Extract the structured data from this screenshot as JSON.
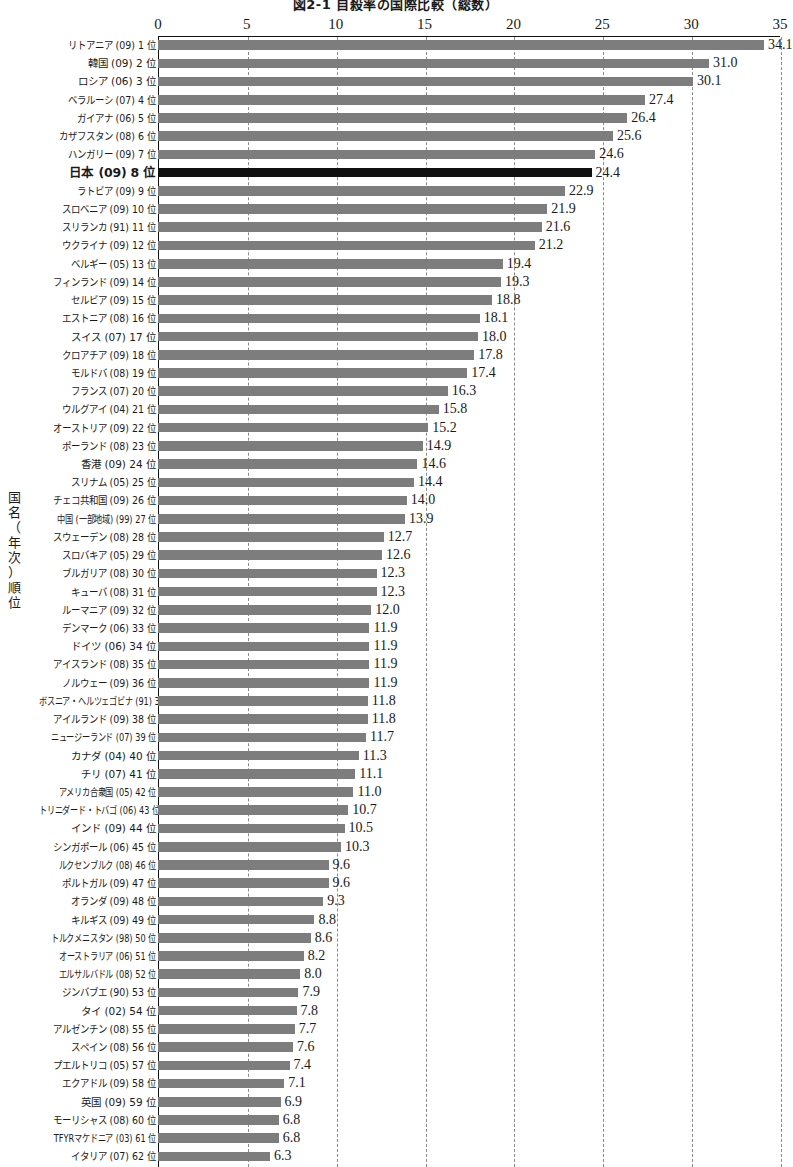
{
  "chart_data": {
    "type": "bar",
    "orientation": "horizontal",
    "title": "図2-1 自殺率の国際比較（総数）",
    "xlabel": "",
    "ylabel": "国名（年次）順位",
    "xlim": [
      0,
      35
    ],
    "xticks": [
      0,
      5,
      10,
      15,
      20,
      25,
      30,
      35
    ],
    "xtick_labels": [
      "0",
      "5",
      "10",
      "15",
      "20",
      "25",
      "30",
      "35"
    ],
    "grid": "vertical-dashed",
    "legend": "none",
    "highlight_category": "日本 (09)  8 位",
    "highlight_color": "#101010",
    "bar_color": "#7d7d7d",
    "categories": [
      "リトアニア (09)  1 位",
      "韓国 (09)  2 位",
      "ロシア (06)  3 位",
      "ベラルーシ (07)  4 位",
      "ガイアナ (06)  5 位",
      "カザフスタン (08)  6 位",
      "ハンガリー (09)  7 位",
      "日本 (09) 8 位",
      "ラトビア (09)  9 位",
      "スロベニア (09) 10 位",
      "スリランカ (91) 11 位",
      "ウクライナ (09) 12 位",
      "ベルギー (05) 13 位",
      "フィンランド (09) 14 位",
      "セルビア (09) 15 位",
      "エストニア (08) 16 位",
      "スイス (07) 17 位",
      "クロアチア (09) 18 位",
      "モルドバ (08) 19 位",
      "フランス (07) 20 位",
      "ウルグアイ (04) 21 位",
      "オーストリア (09) 22 位",
      "ポーランド (08) 23 位",
      "香港 (09) 24 位",
      "スリナム (05) 25 位",
      "チェコ共和国 (09) 26 位",
      "中国 (一部地域) (99) 27 位",
      "スウェーデン (08) 28 位",
      "スロバキア (05) 29 位",
      "ブルガリア (08) 30 位",
      "キューバ (08) 31 位",
      "ルーマニア (09) 32 位",
      "デンマーク (06) 33 位",
      "ドイツ (06) 34 位",
      "アイスランド (08) 35 位",
      "ノルウェー (09) 36 位",
      "ボスニア・ヘルツェゴビナ (91) 37 位",
      "アイルランド (09) 38 位",
      "ニュージーランド (07) 39 位",
      "カナダ (04) 40 位",
      "チリ (07) 41 位",
      "アメリカ合衆国 (05) 42 位",
      "トリニダード・トバゴ (06) 43 位",
      "インド (09) 44 位",
      "シンガポール (06) 45 位",
      "ルクセンブルク (08) 46 位",
      "ポルトガル (09) 47 位",
      "オランダ (09) 48 位",
      "キルギス (09) 49 位",
      "トルクメニスタン (98) 50 位",
      "オーストラリア (06) 51 位",
      "エルサルバドル (08) 52 位",
      "ジンバブエ (90) 53 位",
      "タイ (02) 54 位",
      "アルゼンチン (08) 55 位",
      "スペイン (08) 56 位",
      "プエルトリコ (05) 57 位",
      "エクアドル (09) 58 位",
      "英国 (09) 59 位",
      "モーリシャス (08) 60 位",
      "TFYRマケドニア (03) 61 位",
      "イタリア (07) 62 位"
    ],
    "values": [
      34.1,
      31.0,
      30.1,
      27.4,
      26.4,
      25.6,
      24.6,
      24.4,
      22.9,
      21.9,
      21.6,
      21.2,
      19.4,
      19.3,
      18.8,
      18.1,
      18.0,
      17.8,
      17.4,
      16.3,
      15.8,
      15.2,
      14.9,
      14.6,
      14.4,
      14.0,
      13.9,
      12.7,
      12.6,
      12.3,
      12.3,
      12.0,
      11.9,
      11.9,
      11.9,
      11.9,
      11.8,
      11.8,
      11.7,
      11.3,
      11.1,
      11.0,
      10.7,
      10.5,
      10.3,
      9.6,
      9.6,
      9.3,
      8.8,
      8.6,
      8.2,
      8.0,
      7.9,
      7.8,
      7.7,
      7.6,
      7.4,
      7.1,
      6.9,
      6.8,
      6.8,
      6.3
    ],
    "value_labels": [
      "34.1",
      "31.0",
      "30.1",
      "27.4",
      "26.4",
      "25.6",
      "24.6",
      "24.4",
      "22.9",
      "21.9",
      "21.6",
      "21.2",
      "19.4",
      "19.3",
      "18.8",
      "18.1",
      "18.0",
      "17.8",
      "17.4",
      "16.3",
      "15.8",
      "15.2",
      "14.9",
      "14.6",
      "14.4",
      "14.0",
      "13.9",
      "12.7",
      "12.6",
      "12.3",
      "12.3",
      "12.0",
      "11.9",
      "11.9",
      "11.9",
      "11.9",
      "11.8",
      "11.8",
      "11.7",
      "11.3",
      "11.1",
      "11.0",
      "10.7",
      "10.5",
      "10.3",
      "9.6",
      "9.6",
      "9.3",
      "8.8",
      "8.6",
      "8.2",
      "8.0",
      "7.9",
      "7.8",
      "7.7",
      "7.6",
      "7.4",
      "7.1",
      "6.9",
      "6.8",
      "6.8",
      "6.3"
    ]
  }
}
